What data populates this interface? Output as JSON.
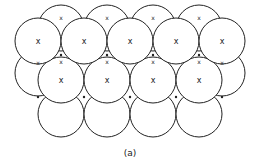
{
  "figure": {
    "label": "(a)",
    "circle_radius": 23,
    "stroke_color": "#222222",
    "layers": {
      "back_top": {
        "cy": 28,
        "cx": [
          61,
          107,
          153,
          199
        ]
      },
      "back_mid": {
        "cy": 73,
        "cx": [
          38,
          222
        ]
      },
      "bottom": {
        "cy": 114,
        "cx": [
          61,
          107,
          153,
          199
        ]
      },
      "top": {
        "cy": 41,
        "cx": [
          38,
          84,
          130,
          176,
          222
        ],
        "marker": "x"
      },
      "middle": {
        "cy": 80,
        "cx": [
          61,
          107,
          153,
          199
        ],
        "marker": "x"
      }
    },
    "interstitial_x_marks": [
      [
        61,
        18
      ],
      [
        107,
        18
      ],
      [
        153,
        18
      ],
      [
        199,
        18
      ],
      [
        61,
        62
      ],
      [
        107,
        62
      ],
      [
        153,
        62
      ],
      [
        199,
        62
      ],
      [
        38,
        63
      ],
      [
        222,
        63
      ]
    ],
    "interstitial_dots": [
      [
        61,
        55
      ],
      [
        107,
        55
      ],
      [
        153,
        55
      ],
      [
        199,
        55
      ],
      [
        38,
        97
      ],
      [
        84,
        97
      ],
      [
        130,
        97
      ],
      [
        176,
        97
      ],
      [
        222,
        97
      ]
    ]
  }
}
